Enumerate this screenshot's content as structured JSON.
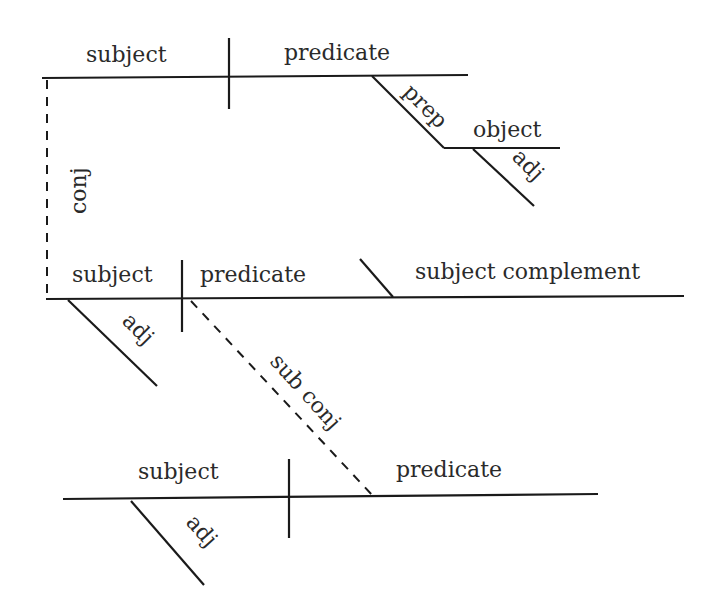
{
  "diagram": {
    "type": "Reed-Kellogg sentence diagram",
    "clause1": {
      "subject": "subject",
      "predicate": "predicate",
      "prep": "prep",
      "object": "object",
      "object_modifier": "adj"
    },
    "conj_label": "conj",
    "clause2": {
      "subject": "subject",
      "subject_modifier": "adj",
      "predicate": "predicate",
      "complement": "subject complement"
    },
    "sub_conj_label": "sub conj",
    "clause3": {
      "subject": "subject",
      "subject_modifier": "adj",
      "predicate": "predicate"
    },
    "colors": {
      "line": "#1a1a1a",
      "text": "#2a2a2a",
      "background": "#ffffff"
    }
  }
}
